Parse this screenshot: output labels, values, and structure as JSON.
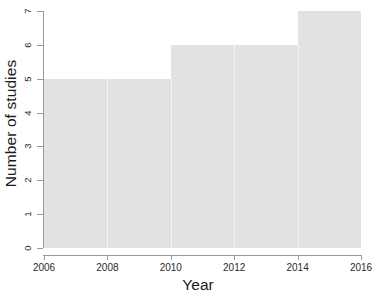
{
  "chart_data": {
    "type": "bar",
    "title": "",
    "subtitle": "",
    "xlabel": "Year",
    "ylabel": "Number of studies",
    "xlim": [
      2006,
      2016
    ],
    "ylim": [
      0,
      7
    ],
    "grid": false,
    "legend": null,
    "bin_width": 2,
    "x_ticks": [
      {
        "value": 2006,
        "label": "2006"
      },
      {
        "value": 2008,
        "label": "2008"
      },
      {
        "value": 2010,
        "label": "2010"
      },
      {
        "value": 2012,
        "label": "2012"
      },
      {
        "value": 2014,
        "label": "2014"
      },
      {
        "value": 2016,
        "label": "2016"
      }
    ],
    "y_ticks": [
      {
        "value": 0,
        "label": "0"
      },
      {
        "value": 1,
        "label": "1"
      },
      {
        "value": 2,
        "label": "2"
      },
      {
        "value": 3,
        "label": "3"
      },
      {
        "value": 4,
        "label": "4"
      },
      {
        "value": 5,
        "label": "5"
      },
      {
        "value": 6,
        "label": "6"
      },
      {
        "value": 7,
        "label": "7"
      }
    ],
    "categories": [
      "2006-2008",
      "2008-2010",
      "2010-2012",
      "2012-2014",
      "2014-2016"
    ],
    "bins": [
      {
        "start": 2006,
        "end": 2008
      },
      {
        "start": 2008,
        "end": 2010
      },
      {
        "start": 2010,
        "end": 2012
      },
      {
        "start": 2012,
        "end": 2014
      },
      {
        "start": 2014,
        "end": 2016
      }
    ],
    "values": [
      5,
      5,
      6,
      6,
      7
    ],
    "bar_color": "#e2e2e2",
    "axis_color": "#9a9a9a",
    "text_color": "#1c1c1c"
  }
}
